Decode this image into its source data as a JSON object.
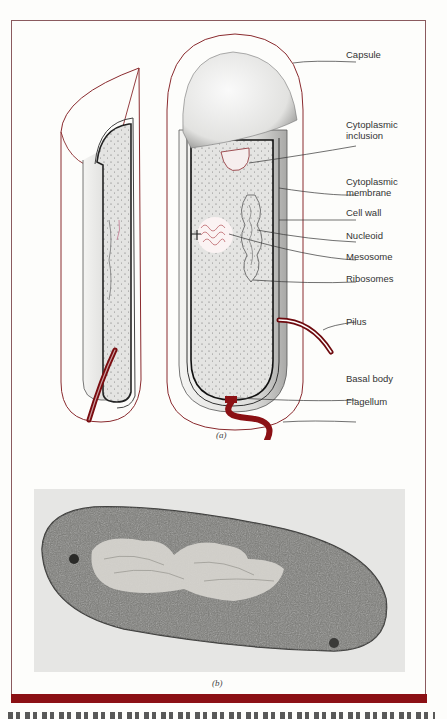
{
  "figure": {
    "panel_a": {
      "caption": "(a)",
      "labels": [
        {
          "id": "capsule",
          "text": "Capsule"
        },
        {
          "id": "cytoplasmic-inclusion",
          "text": "Cytoplasmic\ninclusion"
        },
        {
          "id": "cytoplasmic-membrane",
          "text": "Cytoplasmic\nmembrane"
        },
        {
          "id": "cell-wall",
          "text": "Cell wall"
        },
        {
          "id": "nucleoid",
          "text": "Nucleoid"
        },
        {
          "id": "mesosome",
          "text": "Mesosome"
        },
        {
          "id": "ribosomes",
          "text": "Ribosomes"
        },
        {
          "id": "pilus",
          "text": "Pilus"
        },
        {
          "id": "basal-body",
          "text": "Basal body"
        },
        {
          "id": "flagellum",
          "text": "Flagellum"
        }
      ]
    },
    "panel_b": {
      "caption": "(b)",
      "description": "Electron micrograph of a bacterial cell section"
    },
    "colors": {
      "accent_red": "#8b1014",
      "outline_red": "#8a2a2e",
      "frame": "#8a5a5e"
    }
  }
}
